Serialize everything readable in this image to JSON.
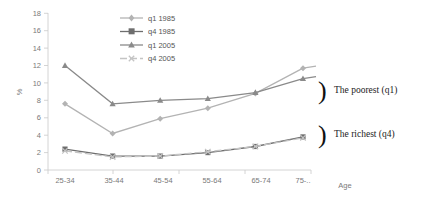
{
  "chart_data": {
    "type": "line",
    "title": "",
    "xlabel": "Age",
    "ylabel": "%",
    "categories": [
      "25-34",
      "35-44",
      "45-54",
      "55-64",
      "65-74",
      "75-.."
    ],
    "ylim": [
      0,
      18
    ],
    "yticks": [
      0,
      2,
      4,
      6,
      8,
      10,
      12,
      14,
      16,
      18
    ],
    "grid": false,
    "legend_position": "top-center",
    "series": [
      {
        "name": "q1 1985",
        "color": "#b3b3b3",
        "marker": "diamond",
        "values": [
          7.6,
          4.2,
          5.9,
          7.1,
          8.8,
          11.7
        ]
      },
      {
        "name": "q4 1985",
        "color": "#6e6e6e",
        "marker": "square",
        "values": [
          2.4,
          1.6,
          1.6,
          2.0,
          2.7,
          3.8
        ]
      },
      {
        "name": "q1 2005",
        "color": "#8a8a8a",
        "marker": "triangle",
        "values": [
          12.0,
          7.6,
          8.0,
          8.2,
          8.9,
          10.5
        ]
      },
      {
        "name": "q4 2005",
        "color": "#c4c4c4",
        "marker": "cross",
        "values": [
          2.2,
          1.5,
          1.6,
          2.1,
          2.7,
          3.7
        ]
      }
    ],
    "annotations": [
      {
        "text": "The poorest (q1)",
        "target": "q1-group"
      },
      {
        "text": "The richest (q4)",
        "target": "q4-group"
      }
    ]
  }
}
